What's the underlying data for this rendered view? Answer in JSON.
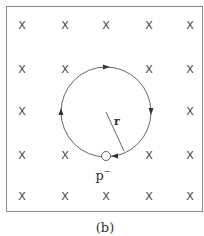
{
  "figure": {
    "caption": "(b)",
    "frame": {
      "x": 6,
      "y": 6,
      "width": 197,
      "height": 206,
      "stroke": "#888888"
    },
    "field_symbol": "X",
    "field_grid": {
      "columns_x": [
        22,
        65,
        106,
        149,
        190
      ],
      "rows_y": [
        25,
        69,
        111,
        155,
        196
      ],
      "hidden_cells": [
        [
          1,
          2
        ],
        [
          2,
          1
        ],
        [
          2,
          2
        ],
        [
          2,
          3
        ],
        [
          3,
          2
        ]
      ]
    },
    "orbit": {
      "center_x": 106,
      "center_y": 112,
      "radius": 45,
      "direction": "clockwise",
      "stroke": "#555555"
    },
    "radius_label": "r",
    "particle": {
      "label": "p",
      "charge": "−",
      "x": 106,
      "y": 156,
      "radius": 4
    },
    "arrows": [
      {
        "name": "top",
        "x": 107,
        "y": 67,
        "direction": "right"
      },
      {
        "name": "right",
        "x": 151,
        "y": 112,
        "direction": "down"
      },
      {
        "name": "left",
        "x": 61,
        "y": 111,
        "direction": "up"
      },
      {
        "name": "bottom-right",
        "x": 112,
        "y": 156,
        "direction": "left"
      }
    ]
  }
}
